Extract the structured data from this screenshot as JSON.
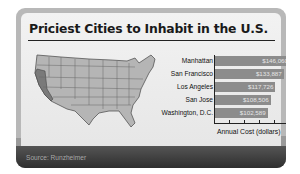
{
  "title": "Priciest Cities to Inhabit in the U.S.",
  "source": "Source: Runzheimer",
  "colors": {
    "bar": "#8c8c8c",
    "frame": "#b8b8b8",
    "panel": "#ececec",
    "band": "#3a3a3a",
    "map_fill": "#b5b5b5",
    "map_highlight": "#7a7a7a"
  },
  "chart_data": {
    "type": "bar",
    "orientation": "horizontal",
    "title": "Priciest Cities to Inhabit in the U.S.",
    "xlabel": "Annual Cost (dollars)",
    "ylabel": "",
    "categories": [
      "Manhattan",
      "San Francisco",
      "Los Angeles",
      "San Jose",
      "Washington, D.C."
    ],
    "values": [
      146060,
      133887,
      117726,
      108506,
      102589
    ],
    "value_labels": [
      "$146,060",
      "$133,887",
      "$117,726",
      "$108,506",
      "$102,589"
    ],
    "xlim": [
      0,
      160000
    ],
    "grid": false,
    "legend": null,
    "source": "Source: Runzheimer"
  }
}
